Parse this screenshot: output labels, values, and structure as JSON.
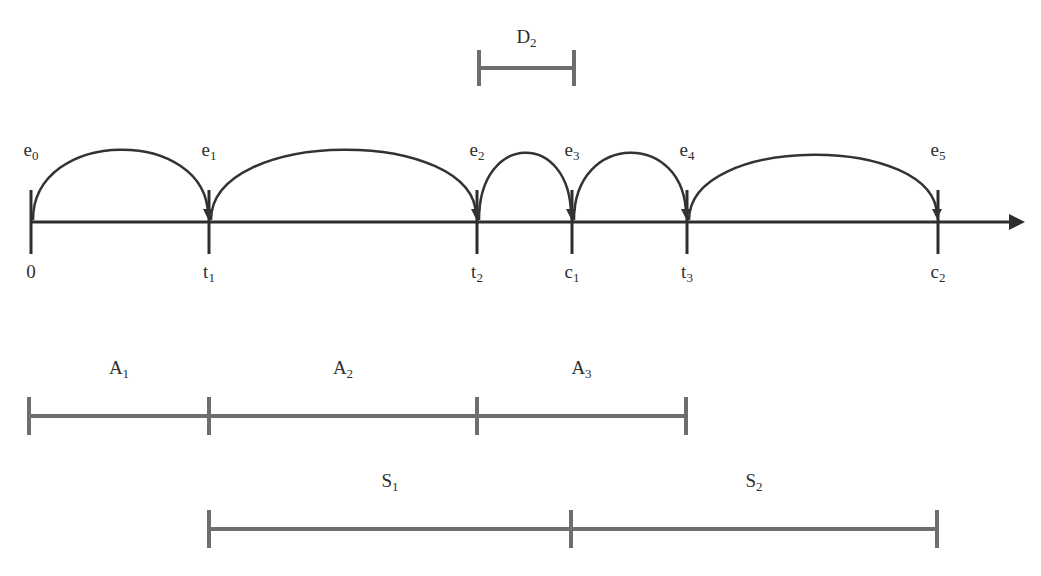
{
  "colors": {
    "axis": "#2e2e2e",
    "arc": "#333333",
    "interval_bar": "#6e6e6e",
    "text": "#2e2e2e",
    "background": "#ffffff"
  },
  "timeline": {
    "axis_y": 222,
    "axis_start_x": 31,
    "axis_end_x": 1025,
    "ticks": [
      {
        "x": 31,
        "base": "0",
        "sub": ""
      },
      {
        "x": 209,
        "base": "t",
        "sub": "1"
      },
      {
        "x": 477,
        "base": "t",
        "sub": "2"
      },
      {
        "x": 572,
        "base": "c",
        "sub": "1"
      },
      {
        "x": 687,
        "base": "t",
        "sub": "3"
      },
      {
        "x": 938,
        "base": "c",
        "sub": "2"
      }
    ],
    "events": [
      {
        "x": 31,
        "base": "e",
        "sub": "0"
      },
      {
        "x": 209,
        "base": "e",
        "sub": "1"
      },
      {
        "x": 477,
        "base": "e",
        "sub": "2"
      },
      {
        "x": 572,
        "base": "e",
        "sub": "3"
      },
      {
        "x": 687,
        "base": "e",
        "sub": "4"
      },
      {
        "x": 938,
        "base": "e",
        "sub": "5"
      }
    ],
    "arcs": [
      {
        "from_x": 31,
        "to_x": 209,
        "peak_y": 150
      },
      {
        "from_x": 209,
        "to_x": 477,
        "peak_y": 150
      },
      {
        "from_x": 477,
        "to_x": 572,
        "peak_y": 153
      },
      {
        "from_x": 572,
        "to_x": 687,
        "peak_y": 153
      },
      {
        "from_x": 687,
        "to_x": 938,
        "peak_y": 155
      }
    ]
  },
  "duration_marker": {
    "label": {
      "base": "D",
      "sub": "2"
    },
    "from_x": 479,
    "to_x": 574,
    "y": 68
  },
  "interval_rows": [
    {
      "name": "A",
      "y": 416,
      "segments": [
        {
          "from_x": 29,
          "to_x": 209,
          "base": "A",
          "sub": "1"
        },
        {
          "from_x": 209,
          "to_x": 477,
          "base": "A",
          "sub": "2"
        },
        {
          "from_x": 477,
          "to_x": 686,
          "base": "A",
          "sub": "3"
        }
      ]
    },
    {
      "name": "S",
      "y": 529,
      "segments": [
        {
          "from_x": 209,
          "to_x": 571,
          "base": "S",
          "sub": "1"
        },
        {
          "from_x": 571,
          "to_x": 937,
          "base": "S",
          "sub": "2"
        }
      ]
    }
  ]
}
